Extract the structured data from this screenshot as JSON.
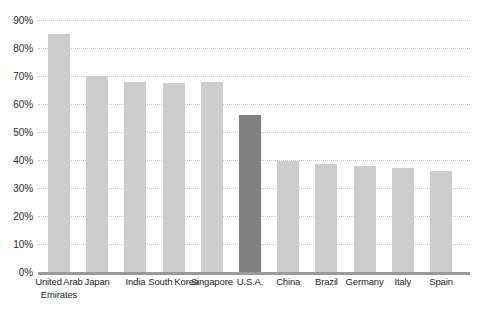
{
  "chart_data": {
    "type": "bar",
    "title": "",
    "subtitle": "",
    "xlabel": "",
    "ylabel": "",
    "ylim": [
      0,
      90
    ],
    "ytick_labels": [
      "0%",
      "10%",
      "20%",
      "30%",
      "40%",
      "50%",
      "60%",
      "70%",
      "80%",
      "90%"
    ],
    "ytick_values": [
      0,
      10,
      20,
      30,
      40,
      50,
      60,
      70,
      80,
      90
    ],
    "grid": "horizontal-dotted",
    "legend": "none",
    "categories": [
      "United Arab Emirates",
      "Japan",
      "India",
      "South Korea",
      "Singapore",
      "U.S.A.",
      "China",
      "Brazil",
      "Germany",
      "Italy",
      "Spain"
    ],
    "values": [
      85,
      70,
      68,
      67.5,
      68,
      56,
      39.5,
      38.5,
      38,
      37,
      36
    ],
    "bar_colors": [
      "#cdcdcd",
      "#cdcdcd",
      "#cdcdcd",
      "#cdcdcd",
      "#cdcdcd",
      "#7f7f7f",
      "#cdcdcd",
      "#cdcdcd",
      "#cdcdcd",
      "#cdcdcd",
      "#cdcdcd"
    ],
    "highlighted_category": "U.S.A.",
    "colors": {
      "background": "#ffffff",
      "bar_default": "#cdcdcd",
      "bar_highlight": "#7f7f7f",
      "gridline": "#c9c9c9",
      "axis_line": "#9a9a9a",
      "tick_text": "#2b2b2b",
      "label_text": "#1d1d1d"
    }
  }
}
